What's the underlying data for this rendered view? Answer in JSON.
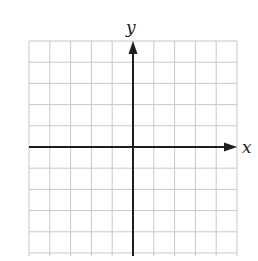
{
  "chart_data": {
    "type": "diagram",
    "title": "",
    "xlabel": "x",
    "ylabel": "y",
    "grid": true,
    "grid_columns": 10,
    "grid_rows": 10,
    "x_range": [
      -5,
      5
    ],
    "y_range": [
      -5,
      5
    ],
    "tick_labels": [],
    "axes_arrows": [
      "positive-x",
      "positive-y"
    ]
  },
  "axes": {
    "x_label": "x",
    "y_label": "y"
  },
  "colors": {
    "grid": "#c8c8c8",
    "axis": "#1e1e1e",
    "background": "#ffffff"
  }
}
